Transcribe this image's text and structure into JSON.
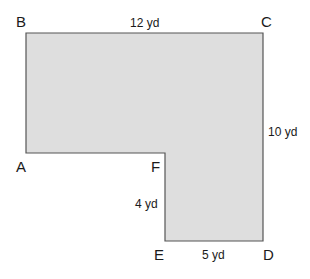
{
  "diagram": {
    "type": "L-shaped polygon",
    "fill_color": "#dedede",
    "stroke_color": "#555555",
    "vertices": [
      {
        "name": "A",
        "label": "A"
      },
      {
        "name": "B",
        "label": "B"
      },
      {
        "name": "C",
        "label": "C"
      },
      {
        "name": "D",
        "label": "D"
      },
      {
        "name": "E",
        "label": "E"
      },
      {
        "name": "F",
        "label": "F"
      }
    ],
    "measurements": {
      "bc": "12 yd",
      "cd": "10 yd",
      "fe": "4 yd",
      "ed": "5 yd"
    }
  }
}
